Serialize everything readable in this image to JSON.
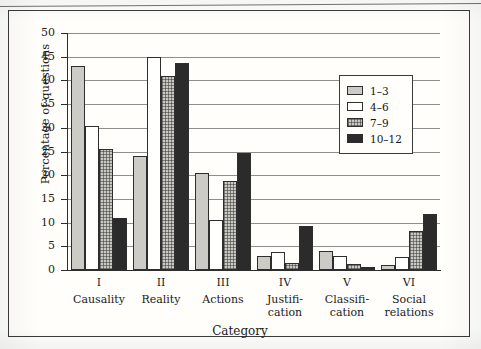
{
  "chart_data": {
    "type": "bar",
    "title": "",
    "xlabel": "Category",
    "ylabel": "Percentage of questions",
    "ylim": [
      0,
      50
    ],
    "ytick_step": 5,
    "yticks": [
      50,
      45,
      40,
      35,
      30,
      25,
      20,
      15,
      10,
      5,
      0
    ],
    "grid": true,
    "legend_position": "upper right inside",
    "categories": [
      {
        "roman": "I",
        "name": "Causality"
      },
      {
        "roman": "II",
        "name": "Reality"
      },
      {
        "roman": "III",
        "name": "Actions"
      },
      {
        "roman": "IV",
        "name": "Justifi-\ncation"
      },
      {
        "roman": "V",
        "name": "Classifi-\ncation"
      },
      {
        "roman": "VI",
        "name": "Social\nrelations"
      }
    ],
    "category_labels": [
      "I Causality",
      "II Reality",
      "III Actions",
      "IV Justification",
      "V Classification",
      "VI Social relations"
    ],
    "series": [
      {
        "name": "1–3",
        "color": "#cccbc6",
        "fill": "light-gray",
        "values": [
          43.0,
          24.0,
          20.5,
          3.0,
          4.0,
          1.0
        ]
      },
      {
        "name": "4–6",
        "color": "#fffffe",
        "fill": "white",
        "values": [
          30.3,
          45.0,
          10.5,
          3.7,
          3.0,
          2.7
        ]
      },
      {
        "name": "7–9",
        "color": "#c9c8c3",
        "fill": "dotted-gray",
        "values": [
          25.5,
          41.0,
          18.7,
          1.5,
          1.2,
          8.3
        ]
      },
      {
        "name": "10–12",
        "color": "#2b2b2b",
        "fill": "black",
        "values": [
          11.0,
          43.7,
          24.7,
          9.3,
          0.7,
          11.8
        ]
      }
    ]
  },
  "legend": {
    "entries": [
      {
        "label": "1–3"
      },
      {
        "label": "4–6"
      },
      {
        "label": "7–9"
      },
      {
        "label": "10–12"
      }
    ]
  },
  "axes": {
    "y_title": "Percentage of questions",
    "x_title": "Category",
    "y_tick_labels": [
      "50",
      "45",
      "40",
      "35",
      "30",
      "25",
      "20",
      "15",
      "10",
      "5",
      "0"
    ]
  }
}
